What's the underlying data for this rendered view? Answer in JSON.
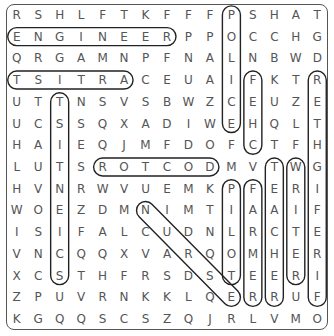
{
  "puzzle": {
    "type": "word-search",
    "rows": 15,
    "cols": 15,
    "grid": [
      "RSHLFTKFFFPSHAT",
      "ENGINEERPPOCCHG",
      "QRGAMNPFNALNBWD",
      "TSITRACEUAIFKTR",
      "UTTNSVSBWZCEUZE",
      "UCSSQXADIWEHQLT",
      "HAIEQJMFDOFCTFH",
      "LUTSROTCODMVTWG",
      "HVNRWVUEMKPFERI",
      "WOEZDMNIMTIAAIF",
      "ISIFALCUDNLRCTE",
      "VNCQQXVARQOMHER",
      "XCSTHFRSDSTEERI",
      "ZPUVRNKKLQERRUF",
      "KGQQSCSZQJRLVMO"
    ],
    "found_words": [
      {
        "word": "ENGINEER",
        "start": [
          1,
          0
        ],
        "end": [
          1,
          7
        ]
      },
      {
        "word": "ARTIST",
        "start": [
          3,
          5
        ],
        "end": [
          3,
          0
        ]
      },
      {
        "word": "DOCTOR",
        "start": [
          7,
          9
        ],
        "end": [
          7,
          4
        ]
      },
      {
        "word": "POLICE",
        "start": [
          0,
          10
        ],
        "end": [
          5,
          10
        ]
      },
      {
        "word": "CHEF",
        "start": [
          6,
          11
        ],
        "end": [
          3,
          11
        ]
      },
      {
        "word": "FIREFIGHTER",
        "start": [
          13,
          14
        ],
        "end": [
          3,
          14
        ]
      },
      {
        "word": "SCIENTIST",
        "start": [
          12,
          2
        ],
        "end": [
          4,
          2
        ]
      },
      {
        "word": "TEACHER",
        "start": [
          7,
          12
        ],
        "end": [
          13,
          12
        ]
      },
      {
        "word": "WRITER",
        "start": [
          7,
          13
        ],
        "end": [
          12,
          13
        ]
      },
      {
        "word": "PILOT",
        "start": [
          8,
          10
        ],
        "end": [
          12,
          10
        ]
      },
      {
        "word": "FARMER",
        "start": [
          8,
          11
        ],
        "end": [
          13,
          11
        ]
      },
      {
        "word": "NURSE",
        "start": [
          9,
          6
        ],
        "end": [
          13,
          10
        ]
      }
    ]
  }
}
